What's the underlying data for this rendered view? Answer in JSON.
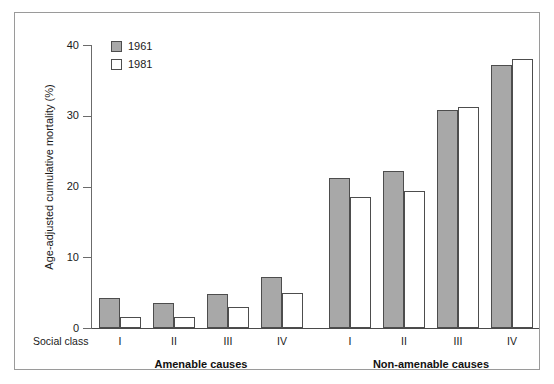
{
  "chart_data": {
    "type": "bar",
    "title": "",
    "xlabel": "Social class",
    "ylabel": "Age-adjusted cumulative mortality (%)",
    "ylim": [
      0,
      40
    ],
    "yticks": [
      0,
      10,
      20,
      30,
      40
    ],
    "ytick_labels": [
      "0",
      "10",
      "20",
      "30",
      "40"
    ],
    "grid": false,
    "legend_position": "top-left",
    "x_axis_prefix_label": "Social class",
    "groups": [
      {
        "name": "Amenable causes",
        "categories": [
          "I",
          "II",
          "III",
          "IV"
        ]
      },
      {
        "name": "Non-amenable causes",
        "categories": [
          "I",
          "II",
          "III",
          "IV"
        ]
      }
    ],
    "categories": [
      "Amenable I",
      "Amenable II",
      "Amenable III",
      "Amenable IV",
      "Non-amenable I",
      "Non-amenable II",
      "Non-amenable III",
      "Non-amenable IV"
    ],
    "series": [
      {
        "name": "1961",
        "color": "#a8a8a8",
        "values": [
          4.2,
          3.6,
          4.8,
          7.2,
          21.2,
          22.2,
          30.8,
          37.2
        ]
      },
      {
        "name": "1981",
        "color": "#ffffff",
        "values": [
          1.6,
          1.6,
          2.9,
          5.0,
          18.5,
          19.3,
          31.3,
          38.0
        ]
      }
    ]
  },
  "legend": {
    "items": [
      {
        "label": "1961",
        "swatch": "filled-gray-swatch"
      },
      {
        "label": "1981",
        "swatch": "empty-white-swatch"
      }
    ]
  },
  "axis": {
    "y_title": "Age-adjusted cumulative mortality (%)",
    "tick_40": "40",
    "tick_30": "30",
    "tick_20": "20",
    "tick_10": "10",
    "tick_0": "0"
  },
  "x_axis": {
    "prefix": "Social class",
    "left_group_label": "Amenable causes",
    "right_group_label": "Non-amenable causes",
    "left_categories": [
      "I",
      "II",
      "III",
      "IV"
    ],
    "right_categories": [
      "I",
      "II",
      "III",
      "IV"
    ]
  },
  "colors": {
    "bar_1961": "#a8a8a8",
    "bar_1981": "#ffffff",
    "bar_outline": "#4d4d4d",
    "axis": "#4a4a4a",
    "frame": "#9a9a9a",
    "text": "#1a1a1a"
  }
}
